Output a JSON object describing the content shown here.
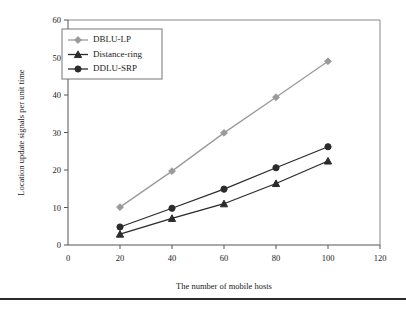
{
  "figure": {
    "background": "#ffffff",
    "bottom_rule_color": "#2b2b2b"
  },
  "chart_data": {
    "type": "line",
    "title": "",
    "xlabel": "The number of mobile hosts",
    "ylabel": "Location update signals per unit time",
    "x": [
      20,
      40,
      60,
      80,
      100
    ],
    "xlim": [
      0,
      120
    ],
    "ylim": [
      0,
      60
    ],
    "xticks": [
      0,
      20,
      40,
      60,
      80,
      100,
      120
    ],
    "yticks": [
      0,
      10,
      20,
      30,
      40,
      50,
      60
    ],
    "grid": false,
    "legend_position": "upper-left",
    "series": [
      {
        "name": "DBLU-LP",
        "marker": "diamond",
        "color": "#9a9a9a",
        "values": [
          10.1,
          19.7,
          29.9,
          39.4,
          49.0
        ]
      },
      {
        "name": "Distance-ring",
        "marker": "triangle",
        "color": "#2b2b2b",
        "values": [
          2.9,
          7.1,
          11.0,
          16.4,
          22.4
        ]
      },
      {
        "name": "DDLU-SRP",
        "marker": "circle",
        "color": "#2b2b2b",
        "values": [
          4.8,
          9.8,
          14.9,
          20.6,
          26.2
        ]
      }
    ]
  }
}
